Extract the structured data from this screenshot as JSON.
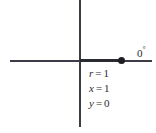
{
  "figure": {
    "angle_label": {
      "value": "0",
      "degree_symbol": "°"
    },
    "point": {
      "name": "point-marker",
      "x": 1,
      "y": 0
    },
    "annotations": [
      {
        "variable": "r",
        "operator": "=",
        "value": "1"
      },
      {
        "variable": "x",
        "operator": "=",
        "value": "1"
      },
      {
        "variable": "y",
        "operator": "=",
        "value": "0"
      }
    ],
    "colors": {
      "axis": "#3c3c46",
      "axis_emphasis": "#2a2a33",
      "point": "#1e1e24",
      "text": "#2a2a33",
      "background": "#ffffff"
    }
  },
  "chart_data": {
    "type": "scatter",
    "title": "",
    "xlabel": "",
    "ylabel": "",
    "grid": false,
    "legend": "none",
    "xlim": [
      -2.0,
      2.0
    ],
    "ylim": [
      -1.5,
      1.5
    ],
    "x": [
      1
    ],
    "y": [
      0
    ],
    "annotations": [
      "0°",
      "r = 1",
      "x = 1",
      "y = 0"
    ]
  }
}
